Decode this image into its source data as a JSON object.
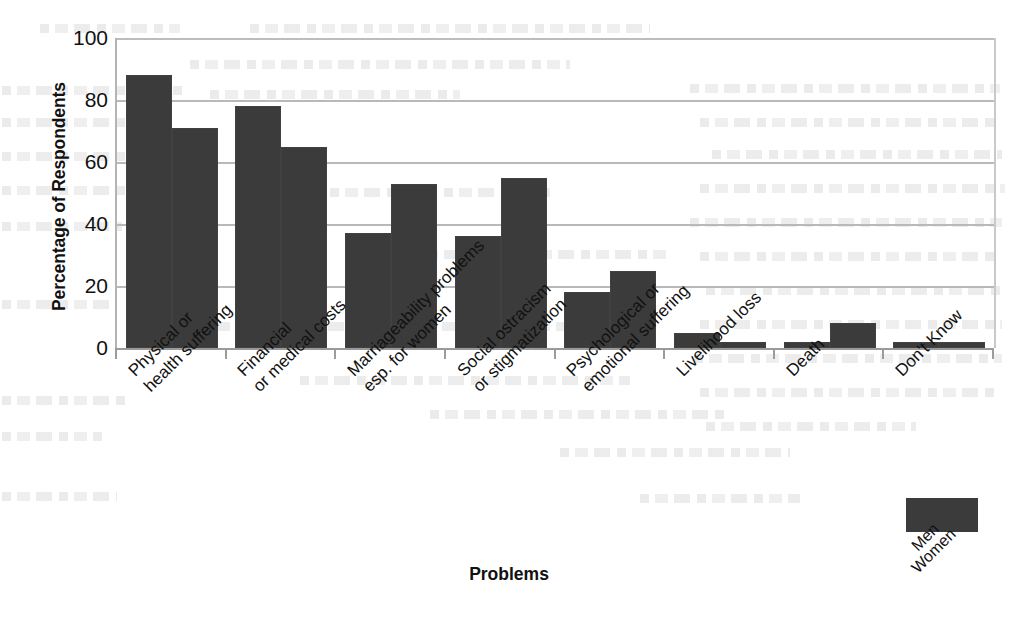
{
  "chart_data": {
    "type": "bar",
    "title": "",
    "xlabel": "Problems",
    "ylabel": "Percentage of Respondents",
    "ylim": [
      0,
      100
    ],
    "yticks": [
      0,
      20,
      40,
      60,
      80,
      100
    ],
    "ytick_labels": [
      "0",
      "20",
      "40",
      "60",
      "80",
      "100"
    ],
    "grid": true,
    "legend_position": "bottom-right",
    "categories": [
      {
        "line1": "Physical or",
        "line2": "health suffering"
      },
      {
        "line1": "Financial",
        "line2": "or medical costs"
      },
      {
        "line1": "Marriageability problems",
        "line2": "esp. for women"
      },
      {
        "line1": "Social ostracism",
        "line2": "or stigmatization"
      },
      {
        "line1": "Psychological or",
        "line2": "emotional suffering"
      },
      {
        "line1": "Livelihood loss",
        "line2": ""
      },
      {
        "line1": "Death",
        "line2": ""
      },
      {
        "line1": "Don't Know",
        "line2": ""
      }
    ],
    "series": [
      {
        "name": "Men",
        "values": [
          88,
          78,
          37,
          36,
          18,
          5,
          2,
          2
        ]
      },
      {
        "name": "Women",
        "values": [
          71,
          65,
          53,
          55,
          25,
          2,
          8,
          2
        ]
      }
    ],
    "colors": {
      "bar": "#3b3b3b",
      "gridline": "#b9b9b9",
      "axis": "#9c9c9c",
      "text": "#111111",
      "background": "#ffffff"
    }
  },
  "legend": {
    "series_labels": [
      "Men",
      "Women"
    ]
  }
}
